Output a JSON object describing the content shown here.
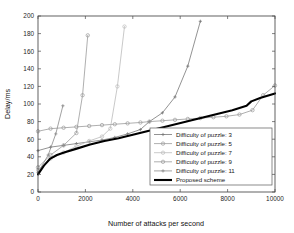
{
  "chart_data": {
    "type": "line",
    "title": "",
    "xlabel": "Number of attacks per second",
    "ylabel": "Delay/ms",
    "xlim": [
      0,
      10000
    ],
    "ylim": [
      0,
      200
    ],
    "xticks": [
      0,
      2000,
      4000,
      6000,
      8000,
      10000
    ],
    "yticks": [
      0,
      20,
      40,
      60,
      80,
      100,
      120,
      140,
      160,
      180,
      200
    ],
    "xtick_labels": [
      "0",
      "2000",
      "4000",
      "6000",
      "8000",
      "10000"
    ],
    "ytick_labels": [
      "0",
      "20",
      "40",
      "60",
      "80",
      "100",
      "120",
      "140",
      "160",
      "180",
      "200"
    ],
    "grid": false,
    "legend_position": "center-right",
    "series": [
      {
        "name": "Difficulty of puzzle: 3",
        "color": "#777777",
        "marker": "plus",
        "line_width": 0.8,
        "x": [
          0,
          530,
          1080,
          1620,
          2160,
          2700,
          3240,
          3780,
          4320,
          4700,
          5250,
          5780,
          6320,
          6850
        ],
        "y": [
          47,
          51,
          53,
          55,
          57,
          59,
          62,
          66,
          71,
          80,
          90,
          108,
          143,
          194
        ]
      },
      {
        "name": "Difficulty of puzzle: 5",
        "color": "#9a9a9a",
        "marker": "circle",
        "line_width": 0.8,
        "x": [
          0,
          530,
          1080,
          1620,
          2160,
          2700,
          3240,
          3780,
          4320,
          4700,
          5250,
          5780,
          6320,
          6850,
          7400,
          7950,
          8500,
          9050,
          9500,
          10000
        ],
        "y": [
          69,
          72,
          73,
          74,
          75,
          76,
          77,
          78,
          79,
          80,
          81,
          82,
          83,
          84,
          85,
          86,
          88,
          93,
          110,
          121
        ]
      },
      {
        "name": "Difficulty of puzzle: 7",
        "color": "#bbbbbb",
        "marker": "circle",
        "line_width": 0.8,
        "x": [
          0,
          530,
          1080,
          1620,
          2160,
          2700,
          3050,
          3350,
          3650
        ],
        "y": [
          25,
          38,
          45,
          52,
          58,
          63,
          72,
          120,
          188
        ]
      },
      {
        "name": "Difficulty of puzzle: 9",
        "color": "#9a9a9a",
        "marker": "circle",
        "line_width": 0.8,
        "x": [
          0,
          530,
          1080,
          1620,
          1880,
          2100
        ],
        "y": [
          28,
          42,
          53,
          67,
          110,
          178
        ]
      },
      {
        "name": "Difficulty of puzzle: 11",
        "color": "#8a8a8a",
        "marker": "plus",
        "line_width": 0.8,
        "x": [
          0,
          430,
          750,
          1050
        ],
        "y": [
          22,
          42,
          66,
          98
        ]
      },
      {
        "name": "Proposed scheme",
        "color": "#000000",
        "marker": "none",
        "line_width": 2.1,
        "x": [
          0,
          250,
          520,
          800,
          1100,
          1600,
          2200,
          2800,
          3400,
          4000,
          4600,
          5200,
          5800,
          6400,
          7000,
          7600,
          8200,
          8800,
          9000,
          9400,
          10000
        ],
        "y": [
          20,
          30,
          38,
          42,
          45,
          49,
          54,
          58,
          61,
          65,
          69,
          73,
          77,
          81,
          85,
          89,
          93,
          98,
          103,
          107,
          112
        ]
      }
    ]
  },
  "legend": {
    "entries": [
      "Difficulty of puzzle: 3",
      "Difficulty of puzzle: 5",
      "Difficulty of puzzle: 7",
      "Difficulty of puzzle: 9",
      "Difficulty of puzzle: 11",
      "Proposed scheme"
    ]
  },
  "axes": {
    "x_title": "Number of attacks per second",
    "y_title": "Delay/ms"
  }
}
